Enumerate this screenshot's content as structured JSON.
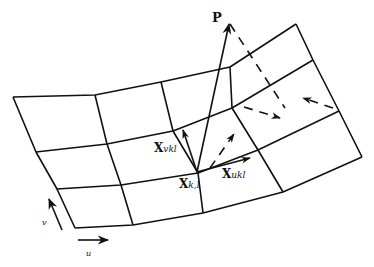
{
  "diagram": {
    "type": "surface-parameter-grid",
    "colors": {
      "line": "#111111",
      "background": "#ffffff"
    },
    "grid": {
      "rows": 4,
      "cols": 5,
      "vertices": [
        [
          [
            13,
            97
          ],
          [
            95,
            95
          ],
          [
            161,
            82
          ],
          [
            230,
            67
          ],
          [
            296,
            24
          ]
        ],
        [
          [
            36,
            152
          ],
          [
            107,
            144
          ],
          [
            173,
            131
          ],
          [
            232,
            108
          ],
          [
            313,
            60
          ]
        ],
        [
          [
            57,
            189
          ],
          [
            121,
            185
          ],
          [
            198,
            173
          ],
          [
            258,
            150
          ],
          [
            339,
            111
          ]
        ],
        [
          [
            75,
            228
          ],
          [
            133,
            225
          ],
          [
            203,
            213
          ],
          [
            283,
            192
          ],
          [
            362,
            157
          ]
        ]
      ]
    },
    "labels": {
      "force": "P",
      "node": "X",
      "node_sub": "k,l",
      "tangent_v": "X",
      "tangent_v_sub": "vkl",
      "tangent_u": "X",
      "tangent_u_sub": "ukl",
      "axis_u": "u",
      "axis_v": "v"
    },
    "vectors": {
      "force_P": {
        "from": [
          197,
          172
        ],
        "to": [
          229,
          22
        ]
      },
      "tangent_v": {
        "from": [
          197,
          172
        ],
        "to": [
          183,
          128
        ]
      },
      "tangent_u": {
        "from": [
          197,
          172
        ],
        "to": [
          250,
          158
        ]
      }
    },
    "dashed_arrows": [
      {
        "name": "projection-line",
        "from": [
          230,
          22
        ],
        "to": [
          285,
          108
        ]
      },
      {
        "name": "projection-arrow-center",
        "from": [
          218,
          156
        ],
        "to": [
          234,
          134
        ]
      },
      {
        "name": "projection-arrow-right",
        "from": [
          244,
          107
        ],
        "to": [
          278,
          117
        ]
      },
      {
        "name": "projection-arrow-left",
        "from": [
          333,
          108
        ],
        "to": [
          305,
          99
        ]
      }
    ],
    "axis_arrows": {
      "u": {
        "from": [
          78,
          240
        ],
        "to": [
          108,
          240
        ]
      },
      "v": {
        "from": [
          61,
          228
        ],
        "to": [
          50,
          201
        ]
      }
    }
  }
}
